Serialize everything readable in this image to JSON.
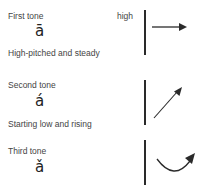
{
  "tones": [
    {
      "name": "First tone",
      "glyph": "ā",
      "description": "High-pitched and steady",
      "level_label": "high",
      "contour": "flat"
    },
    {
      "name": "Second tone",
      "glyph": "á",
      "description": "Starting low and rising",
      "contour": "rising"
    },
    {
      "name": "Third tone",
      "glyph": "ǎ",
      "description": "",
      "contour": "dipping"
    }
  ],
  "colors": {
    "text": "#444444",
    "line": "#2a2a2a"
  }
}
